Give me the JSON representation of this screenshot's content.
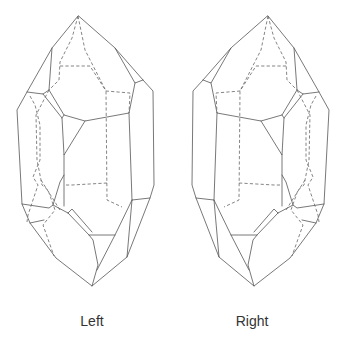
{
  "figure": {
    "type": "crystal-drawings",
    "crystals": [
      {
        "id": "left",
        "label": "Left"
      },
      {
        "id": "right",
        "label": "Right"
      }
    ],
    "colors": {
      "line": "#555555",
      "background": "#ffffff",
      "text": "#333333"
    }
  }
}
